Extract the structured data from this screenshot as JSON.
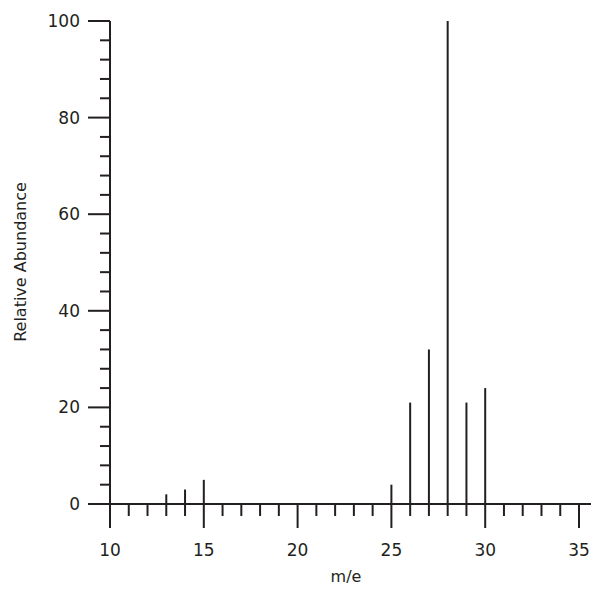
{
  "chart_data": {
    "type": "bar",
    "style": "stick-spectrum",
    "title": "",
    "xlabel": "m/e",
    "ylabel": "Relative Abundance",
    "xlim": [
      10,
      35
    ],
    "ylim": [
      0,
      100
    ],
    "x_ticks": [
      10,
      15,
      20,
      25,
      30,
      35
    ],
    "y_ticks": [
      0,
      20,
      40,
      60,
      80,
      100
    ],
    "x_minor_step": 1,
    "y_minor_step": 4,
    "grid": false,
    "legend": null,
    "x": [
      13,
      14,
      15,
      25,
      26,
      27,
      28,
      29,
      30
    ],
    "values": [
      2,
      3,
      5,
      4,
      21,
      32,
      100,
      21,
      24
    ],
    "color": "#231f20"
  }
}
